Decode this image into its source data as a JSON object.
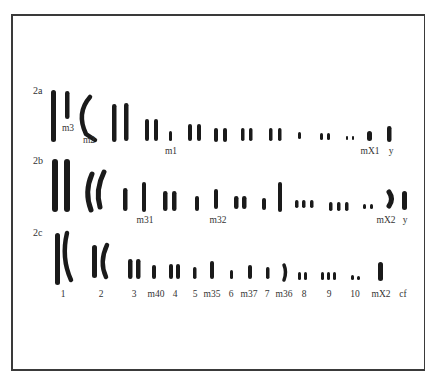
{
  "figure": {
    "type": "karyotype",
    "rows": [
      {
        "label": "2a",
        "chromosome_labels": [
          "m3",
          "m2",
          "m1",
          "mX1",
          "y"
        ]
      },
      {
        "label": "2b",
        "chromosome_labels": [
          "m31",
          "m32",
          "mX2",
          "y"
        ]
      },
      {
        "label": "2c",
        "chromosome_labels": [
          "1",
          "2",
          "3",
          "m40",
          "4",
          "5",
          "m35",
          "6",
          "m37",
          "7",
          "m36",
          "8",
          "9",
          "10",
          "mX2",
          "cf"
        ]
      }
    ]
  }
}
